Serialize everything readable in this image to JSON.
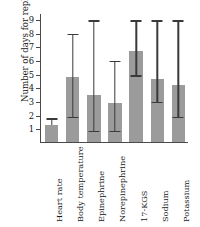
{
  "chart_data": {
    "type": "bar",
    "title": "",
    "xlabel": "",
    "ylabel": "Number of days for rephasal",
    "categories": [
      "Heart rate",
      "Body temperature",
      "Epinephrine",
      "Norepinephrine",
      "17-KGS",
      "Sodium",
      "Potassium"
    ],
    "values": [
      1.3,
      4.85,
      3.55,
      2.9,
      6.75,
      4.7,
      4.25
    ],
    "error_low": [
      1.3,
      1.9,
      0.9,
      0.9,
      4.95,
      3.0,
      1.9
    ],
    "error_high": [
      1.8,
      8.0,
      9.0,
      6.0,
      9.0,
      9.0,
      9.0
    ],
    "yticks": [
      1,
      2,
      3,
      4,
      5,
      6,
      7,
      8,
      9
    ],
    "yticklabels": [
      "1",
      "2",
      "3",
      "4",
      "5",
      "6",
      "7",
      "8",
      "9"
    ],
    "ylim": [
      0,
      9.45
    ],
    "grid": false,
    "legend": false,
    "bar_color": "#9b9b9b",
    "error_color": "#3a3a3a",
    "axis_color": "#4a4a4a",
    "background": "#ffffff"
  }
}
